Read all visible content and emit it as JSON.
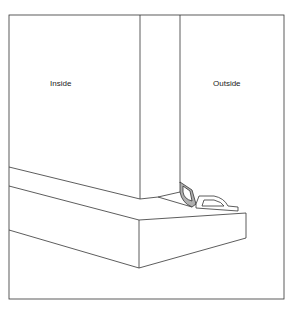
{
  "diagram": {
    "labels": {
      "inside": "Inside",
      "outside": "Outside"
    },
    "colors": {
      "line": "#333333",
      "seal_fill": "#b0b0b0"
    }
  }
}
